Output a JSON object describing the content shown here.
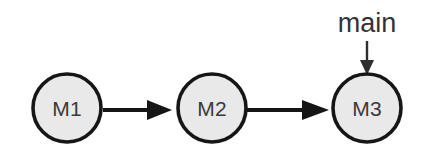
{
  "diagram": {
    "background_color": "#ffffff",
    "node_fill_color": "#e9e9e9",
    "node_stroke_color": "#161616",
    "edge_color": "#151515",
    "label_color": "#3a3a3a",
    "entry_arrow_color": "#2e2e2e",
    "nodes": [
      {
        "id": "m1",
        "label": "M1",
        "cx": 67,
        "cy": 108,
        "r": 34
      },
      {
        "id": "m2",
        "label": "M2",
        "cx": 212,
        "cy": 108,
        "r": 34
      },
      {
        "id": "m3",
        "label": "M3",
        "cx": 367,
        "cy": 108,
        "r": 34
      }
    ],
    "edges": [
      {
        "id": "e1",
        "from": "m1",
        "to": "m2",
        "direction": "right"
      },
      {
        "id": "e2",
        "from": "m2",
        "to": "m3",
        "direction": "right"
      }
    ],
    "entry_point": {
      "label": "main",
      "target": "m3",
      "direction": "down",
      "label_x": 367,
      "label_y": 30
    }
  }
}
